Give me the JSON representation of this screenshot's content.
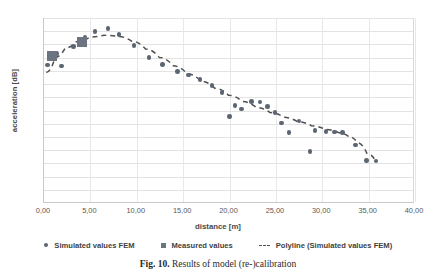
{
  "chart_data": {
    "type": "scatter",
    "title": "",
    "xlabel": "distance [m]",
    "ylabel": "acceleration [dB]",
    "xlim": [
      0,
      40
    ],
    "ylim": [
      0,
      70
    ],
    "xticks": [
      "0,00",
      "5,00",
      "10,00",
      "15,00",
      "20,00",
      "25,00",
      "30,00",
      "35,00",
      "40,00"
    ],
    "xtick_values": [
      0,
      5,
      10,
      15,
      20,
      25,
      30,
      35,
      40
    ],
    "yticks": [
      "0",
      "5",
      "10",
      "15",
      "20",
      "25",
      "30",
      "35",
      "40",
      "45",
      "50",
      "55",
      "60",
      "65",
      "70"
    ],
    "ytick_values": [
      0,
      5,
      10,
      15,
      20,
      25,
      30,
      35,
      40,
      45,
      50,
      55,
      60,
      65,
      70
    ],
    "grid": true,
    "legend_position": "bottom",
    "series": [
      {
        "name": "Simulated values FEM",
        "marker": "circle",
        "color": "#5b6672",
        "points": [
          [
            0.35,
            52.2
          ],
          [
            1.35,
            56.5
          ],
          [
            1.9,
            51.9
          ],
          [
            3.2,
            59.3
          ],
          [
            4.4,
            62.8
          ],
          [
            5.5,
            64.9
          ],
          [
            6.9,
            66.0
          ],
          [
            8.1,
            63.7
          ],
          [
            9.7,
            59.5
          ],
          [
            11.3,
            55.0
          ],
          [
            12.8,
            52.3
          ],
          [
            14.4,
            49.7
          ],
          [
            15.6,
            48.5
          ],
          [
            16.8,
            46.7
          ],
          [
            18.1,
            44.4
          ],
          [
            19.2,
            41.7
          ],
          [
            20.0,
            32.8
          ],
          [
            20.6,
            37.0
          ],
          [
            21.3,
            35.5
          ],
          [
            22.4,
            38.3
          ],
          [
            23.3,
            38.2
          ],
          [
            24.1,
            36.6
          ],
          [
            24.9,
            34.3
          ],
          [
            25.6,
            30.2
          ],
          [
            26.4,
            26.6
          ],
          [
            27.5,
            31.0
          ],
          [
            28.7,
            19.5
          ],
          [
            29.2,
            27.4
          ],
          [
            30.4,
            27.0
          ],
          [
            31.3,
            26.8
          ],
          [
            32.2,
            26.7
          ],
          [
            33.6,
            22.0
          ],
          [
            34.8,
            16.0
          ],
          [
            35.8,
            15.9
          ]
        ]
      },
      {
        "name": "Measured values",
        "marker": "square",
        "color": "#6b7480",
        "points": [
          [
            0.9,
            55.6
          ],
          [
            4.1,
            60.9
          ]
        ]
      },
      {
        "name": "Polyline (Simulated values FEM)",
        "marker": "dashed-line",
        "color": "#4f4f4f",
        "points": [
          [
            0.25,
            49.3
          ],
          [
            1.2,
            55.0
          ],
          [
            2.3,
            58.6
          ],
          [
            3.5,
            61.0
          ],
          [
            5.0,
            62.8
          ],
          [
            6.5,
            63.4
          ],
          [
            8.0,
            63.0
          ],
          [
            9.5,
            61.2
          ],
          [
            11.0,
            58.2
          ],
          [
            12.5,
            55.0
          ],
          [
            14.0,
            51.8
          ],
          [
            15.5,
            48.8
          ],
          [
            17.0,
            46.0
          ],
          [
            18.5,
            43.3
          ],
          [
            20.0,
            40.6
          ],
          [
            21.5,
            38.2
          ],
          [
            23.0,
            36.0
          ],
          [
            24.5,
            34.0
          ],
          [
            26.0,
            32.2
          ],
          [
            27.5,
            30.5
          ],
          [
            29.0,
            29.0
          ],
          [
            30.5,
            27.6
          ],
          [
            32.0,
            26.3
          ],
          [
            33.0,
            25.0
          ],
          [
            34.0,
            22.5
          ],
          [
            35.0,
            18.5
          ],
          [
            35.9,
            15.9
          ]
        ]
      }
    ]
  },
  "legend": [
    {
      "label": "Simulated values FEM",
      "glyph": "dot"
    },
    {
      "label": "Measured values",
      "glyph": "square"
    },
    {
      "label": "Polyline (Simulated values FEM)",
      "glyph": "dash"
    }
  ],
  "caption": {
    "figure_number": "Fig. 10.",
    "text": "Results of model (re-)calibration"
  }
}
